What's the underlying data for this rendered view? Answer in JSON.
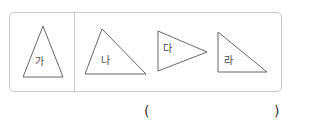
{
  "figure": {
    "stroke_color": "#555555",
    "border_color": "#c8c8c8",
    "reference_shape": {
      "label": "가"
    },
    "options": [
      {
        "label": "나"
      },
      {
        "label": "다"
      },
      {
        "label": "라"
      }
    ]
  },
  "answer": {
    "open_paren": "(",
    "close_paren": ")",
    "value": ""
  }
}
